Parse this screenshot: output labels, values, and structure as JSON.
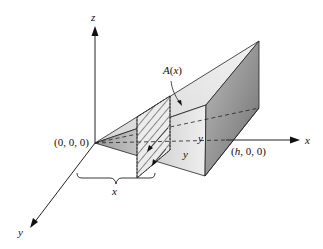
{
  "diagram": {
    "axes": {
      "x_label": "x",
      "y_label": "y",
      "z_label": "z"
    },
    "points": {
      "origin_label": "(0, 0, 0)",
      "h_label_prefix": "(",
      "h_label_var": "h",
      "h_label_suffix": ", 0, 0)"
    },
    "cross_section": {
      "area_label_fn": "A",
      "area_label_arg": "x",
      "side_label_top": "y",
      "side_label_bottom": "y"
    },
    "brace_label": "x",
    "colors": {
      "line": "#111111",
      "light_face": "#e8e8e8",
      "mid_face": "#c8c8c8",
      "dark_face": "#8a8a8a"
    }
  }
}
